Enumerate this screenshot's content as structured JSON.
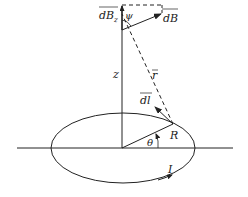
{
  "diagram": {
    "type": "physics-diagram",
    "colors": {
      "stroke": "#222222",
      "background": "#ffffff"
    },
    "labels": {
      "dBz": "dB",
      "dBz_sub": "z",
      "psi": "ψ",
      "dB": "dB",
      "z": "z",
      "r": "r",
      "dl": "dl",
      "R": "R",
      "theta": "θ",
      "I": "I"
    },
    "elements": [
      {
        "name": "current-loop",
        "shape": "ellipse",
        "note": "circular loop seen in perspective"
      },
      {
        "name": "horizontal-axis",
        "shape": "line"
      },
      {
        "name": "z-axis",
        "shape": "line"
      },
      {
        "name": "radius-R",
        "shape": "line",
        "label": "R"
      },
      {
        "name": "position-vector-r",
        "shape": "dashed-line",
        "label": "r"
      },
      {
        "name": "current-element-dl",
        "shape": "arrow",
        "label": "dl"
      },
      {
        "name": "field-dB",
        "shape": "arrow",
        "label": "dB"
      },
      {
        "name": "field-component-dBz",
        "shape": "arrow",
        "label": "dBz"
      },
      {
        "name": "dB-projection",
        "shape": "dashed-line"
      },
      {
        "name": "angle-psi",
        "shape": "arc",
        "label": "ψ"
      },
      {
        "name": "angle-theta",
        "shape": "arc-arrow",
        "label": "θ"
      },
      {
        "name": "current-direction",
        "shape": "arrow",
        "label": "I"
      }
    ]
  }
}
